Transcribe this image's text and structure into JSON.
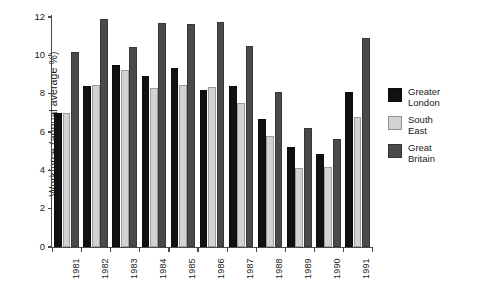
{
  "chart_data": {
    "type": "bar",
    "title": "",
    "xlabel": "",
    "ylabel": "Workforce (annual average %)",
    "ylim": [
      0,
      12
    ],
    "yticks": [
      0,
      2,
      4,
      6,
      8,
      10,
      12
    ],
    "ytick_labels": [
      "0",
      "2",
      "4",
      "6",
      "8",
      "10",
      "12"
    ],
    "grid": false,
    "legend_position": "right",
    "categories": [
      "1981",
      "1982",
      "1983",
      "1984",
      "1985",
      "1986",
      "1987",
      "1988",
      "1989",
      "1990",
      "1991"
    ],
    "series": [
      {
        "name": "Greater London",
        "color": "#111111",
        "values": [
          7.0,
          8.4,
          9.5,
          8.9,
          9.35,
          8.2,
          8.4,
          6.7,
          5.2,
          4.85,
          8.1
        ]
      },
      {
        "name": "South East",
        "color": "#d2d2d2",
        "values": [
          7.0,
          8.45,
          9.25,
          8.3,
          8.45,
          8.35,
          7.5,
          5.8,
          4.1,
          4.15,
          6.8
        ]
      },
      {
        "name": "Great Britain",
        "color": "#4a4a4a",
        "values": [
          10.2,
          11.9,
          10.45,
          11.7,
          11.65,
          11.75,
          10.5,
          8.1,
          6.2,
          5.65,
          10.9
        ]
      }
    ]
  },
  "legend": {
    "entries": [
      {
        "label": "Greater\nLondon",
        "color": "#111111"
      },
      {
        "label": "South\nEast",
        "color": "#d2d2d2"
      },
      {
        "label": "Great\nBritain",
        "color": "#4a4a4a"
      }
    ]
  },
  "axes": {
    "y_title": "Workforce (annual average %)"
  }
}
